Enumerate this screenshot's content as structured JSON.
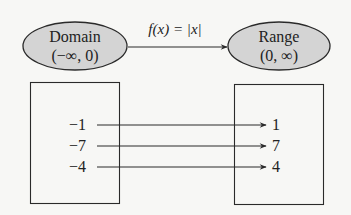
{
  "domain_ellipse": {
    "title": "Domain",
    "interval": "(−∞, 0)",
    "fill": "#d4d4d4"
  },
  "range_ellipse": {
    "title": "Range",
    "interval": "(0, ∞)",
    "fill": "#d4d4d4"
  },
  "function": {
    "name": "f",
    "variable": "x",
    "label_prefix": "f(x) = ",
    "label_body": "|x|"
  },
  "mapping": [
    {
      "input": "−1",
      "output": "1"
    },
    {
      "input": "−7",
      "output": "7"
    },
    {
      "input": "−4",
      "output": "4"
    }
  ],
  "colors": {
    "stroke": "#2a2a2a",
    "background": "#f7f7f5",
    "ellipse_fill": "#d4d4d4"
  }
}
